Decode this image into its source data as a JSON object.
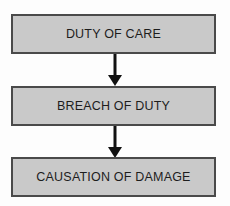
{
  "diagram": {
    "type": "vertical-flowchart",
    "background_color": "#fdfdfd",
    "node_fill_color": "#c9c9c9",
    "node_border_color": "#4a4a4a",
    "text_color": "#1d1d1d",
    "arrow_color": "#111111",
    "nodes": [
      {
        "id": "duty-of-care",
        "label": "DUTY OF CARE"
      },
      {
        "id": "breach-of-duty",
        "label": "BREACH OF DUTY"
      },
      {
        "id": "causation",
        "label": "CAUSATION OF DAMAGE"
      }
    ],
    "connectors": [
      {
        "id": "connector-1",
        "from": "duty-of-care",
        "to": "breach-of-duty",
        "style": "arrow-down"
      },
      {
        "id": "connector-2",
        "from": "breach-of-duty",
        "to": "causation",
        "style": "arrow-down"
      }
    ]
  }
}
